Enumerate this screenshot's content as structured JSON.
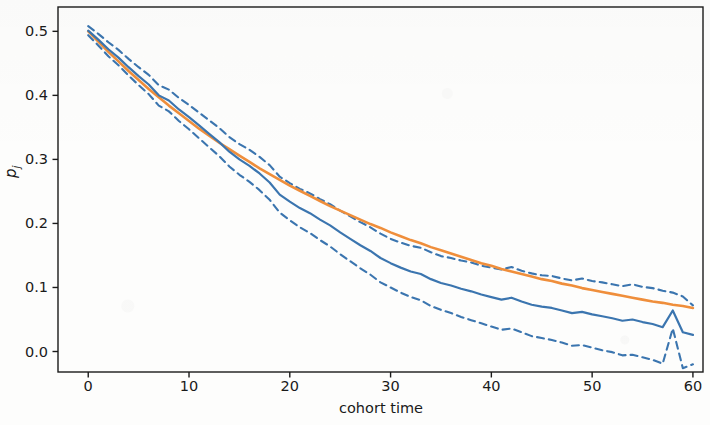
{
  "chart_data": {
    "type": "line",
    "title": "",
    "subtitle": "",
    "xlabel": "cohort time",
    "ylabel": "p_j",
    "ylabel_display": "p",
    "ylabel_subscript": "j",
    "xlim": [
      -3,
      61
    ],
    "ylim": [
      -0.032,
      0.538
    ],
    "xticks": [
      0,
      10,
      20,
      30,
      40,
      50,
      60
    ],
    "xticklabels": [
      "0",
      "10",
      "20",
      "30",
      "40",
      "50",
      "60"
    ],
    "yticks": [
      0.0,
      0.1,
      0.2,
      0.3,
      0.4,
      0.5
    ],
    "yticklabels": [
      "0.0",
      "0.1",
      "0.2",
      "0.3",
      "0.4",
      "0.5"
    ],
    "grid": false,
    "legend": "none",
    "colors": {
      "estimate": "#3b75af",
      "band": "#3b75af",
      "fit": "#ef8e3b",
      "axis": "#1a1a1a",
      "background": "#ffffff"
    },
    "styles": {
      "estimate": "solid",
      "band": "dashed",
      "fit": "solid"
    },
    "x": [
      0,
      1,
      2,
      3,
      4,
      5,
      6,
      7,
      8,
      9,
      10,
      11,
      12,
      13,
      14,
      15,
      16,
      17,
      18,
      19,
      20,
      21,
      22,
      23,
      24,
      25,
      26,
      27,
      28,
      29,
      30,
      31,
      32,
      33,
      34,
      35,
      36,
      37,
      38,
      39,
      40,
      41,
      42,
      43,
      44,
      45,
      46,
      47,
      48,
      49,
      50,
      51,
      52,
      53,
      54,
      55,
      56,
      57,
      58,
      59,
      60
    ],
    "series": [
      {
        "name": "empirical estimate",
        "style": "solid",
        "color": "#3b75af",
        "values": [
          0.501,
          0.487,
          0.472,
          0.459,
          0.444,
          0.43,
          0.417,
          0.4,
          0.392,
          0.378,
          0.366,
          0.353,
          0.34,
          0.327,
          0.312,
          0.3,
          0.29,
          0.278,
          0.264,
          0.245,
          0.234,
          0.224,
          0.216,
          0.206,
          0.197,
          0.186,
          0.176,
          0.166,
          0.157,
          0.146,
          0.138,
          0.131,
          0.125,
          0.121,
          0.113,
          0.107,
          0.103,
          0.098,
          0.094,
          0.089,
          0.085,
          0.081,
          0.084,
          0.078,
          0.073,
          0.07,
          0.068,
          0.064,
          0.06,
          0.062,
          0.058,
          0.055,
          0.052,
          0.048,
          0.05,
          0.046,
          0.043,
          0.038,
          0.064,
          0.03,
          0.026
        ]
      },
      {
        "name": "upper confidence band",
        "style": "dashed",
        "color": "#3b75af",
        "values": [
          0.508,
          0.496,
          0.483,
          0.471,
          0.457,
          0.444,
          0.432,
          0.416,
          0.409,
          0.396,
          0.385,
          0.373,
          0.361,
          0.349,
          0.335,
          0.324,
          0.315,
          0.304,
          0.291,
          0.273,
          0.263,
          0.254,
          0.247,
          0.238,
          0.23,
          0.22,
          0.211,
          0.202,
          0.194,
          0.184,
          0.176,
          0.17,
          0.165,
          0.162,
          0.155,
          0.149,
          0.146,
          0.142,
          0.139,
          0.134,
          0.131,
          0.128,
          0.132,
          0.126,
          0.122,
          0.119,
          0.118,
          0.114,
          0.111,
          0.114,
          0.11,
          0.108,
          0.105,
          0.102,
          0.105,
          0.101,
          0.099,
          0.095,
          0.092,
          0.086,
          0.072
        ]
      },
      {
        "name": "lower confidence band",
        "style": "dashed",
        "color": "#3b75af",
        "values": [
          0.494,
          0.478,
          0.461,
          0.447,
          0.431,
          0.416,
          0.402,
          0.384,
          0.375,
          0.36,
          0.347,
          0.333,
          0.319,
          0.305,
          0.289,
          0.276,
          0.265,
          0.252,
          0.237,
          0.217,
          0.205,
          0.194,
          0.185,
          0.174,
          0.164,
          0.152,
          0.141,
          0.13,
          0.12,
          0.108,
          0.1,
          0.092,
          0.085,
          0.08,
          0.071,
          0.065,
          0.06,
          0.054,
          0.049,
          0.044,
          0.039,
          0.034,
          0.036,
          0.03,
          0.024,
          0.021,
          0.018,
          0.014,
          0.009,
          0.01,
          0.006,
          0.002,
          -0.001,
          -0.006,
          -0.005,
          -0.009,
          -0.013,
          -0.019,
          0.036,
          -0.026,
          -0.02
        ]
      },
      {
        "name": "fitted model",
        "style": "solid",
        "color": "#ef8e3b",
        "values": [
          0.5,
          0.484,
          0.468,
          0.453,
          0.438,
          0.424,
          0.41,
          0.397,
          0.384,
          0.372,
          0.36,
          0.348,
          0.337,
          0.326,
          0.316,
          0.306,
          0.296,
          0.286,
          0.277,
          0.268,
          0.259,
          0.251,
          0.243,
          0.235,
          0.227,
          0.22,
          0.213,
          0.206,
          0.199,
          0.193,
          0.186,
          0.18,
          0.174,
          0.169,
          0.163,
          0.158,
          0.153,
          0.148,
          0.143,
          0.138,
          0.134,
          0.129,
          0.125,
          0.121,
          0.117,
          0.113,
          0.11,
          0.106,
          0.103,
          0.099,
          0.096,
          0.093,
          0.09,
          0.087,
          0.084,
          0.081,
          0.078,
          0.076,
          0.073,
          0.071,
          0.068
        ]
      }
    ]
  }
}
